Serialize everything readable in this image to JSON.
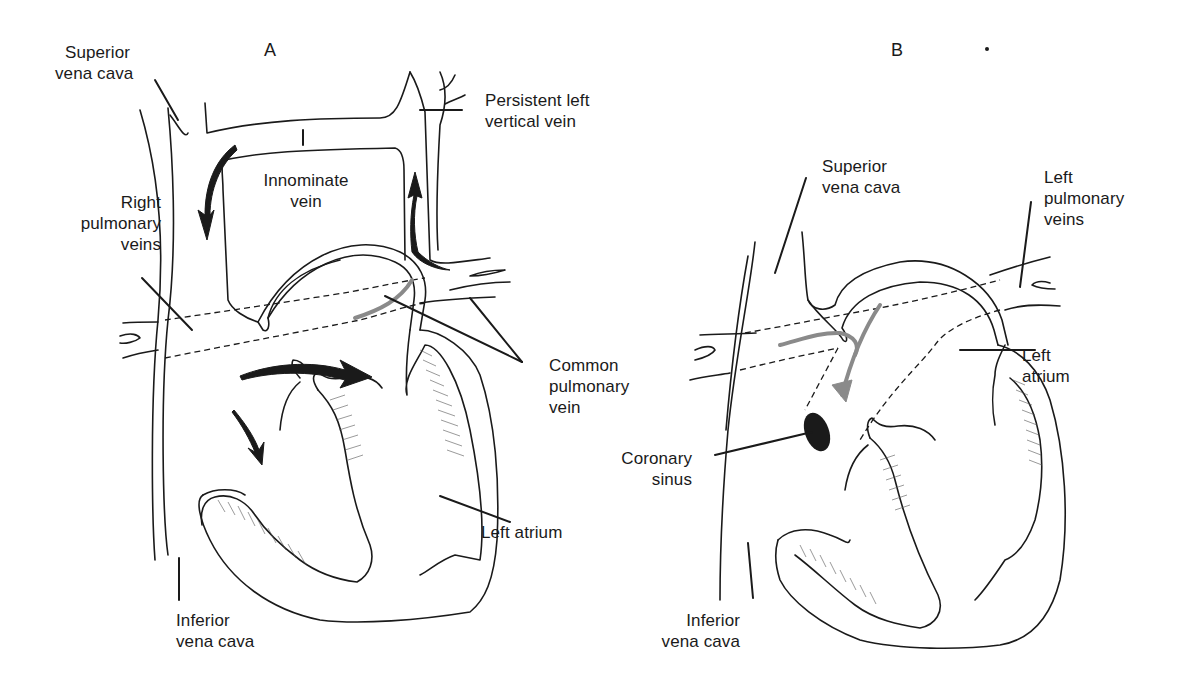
{
  "figure": {
    "panels": [
      {
        "id": "A",
        "letter": "A",
        "labels": {
          "superior_vena_cava": [
            "Superior",
            "vena cava"
          ],
          "persistent_left_vertical_vein": [
            "Persistent left",
            "vertical vein"
          ],
          "innominate_vein": [
            "Innominate",
            "vein"
          ],
          "right_pulmonary_veins": [
            "Right",
            "pulmonary",
            "veins"
          ],
          "common_pulmonary_vein": [
            "Common",
            "pulmonary",
            "vein"
          ],
          "left_atrium": [
            "Left atrium"
          ],
          "inferior_vena_cava": [
            "Inferior",
            "vena cava"
          ]
        }
      },
      {
        "id": "B",
        "letter": "B",
        "labels": {
          "superior_vena_cava": [
            "Superior",
            "vena cava"
          ],
          "left_pulmonary_veins": [
            "Left",
            "pulmonary",
            "veins"
          ],
          "left_atrium": [
            "Left",
            "atrium"
          ],
          "coronary_sinus": [
            "Coronary",
            "sinus"
          ],
          "inferior_vena_cava": [
            "Inferior",
            "vena cava"
          ]
        }
      }
    ],
    "colors": {
      "ink": "#1a1a1a",
      "flow_arrow_gray": "#8a8a8a",
      "background": "#ffffff"
    }
  }
}
